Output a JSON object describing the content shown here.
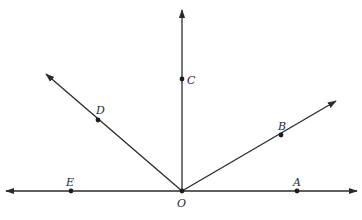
{
  "diagram": {
    "type": "rays-from-point",
    "stroke_color": "#2a2a2a",
    "points": {
      "O": {
        "label": "O",
        "x": 182,
        "y": 191
      },
      "A": {
        "label": "A",
        "x": 297,
        "y": 191
      },
      "B": {
        "label": "B",
        "x": 281,
        "y": 135
      },
      "C": {
        "label": "C",
        "x": 182,
        "y": 79
      },
      "D": {
        "label": "D",
        "x": 98,
        "y": 120
      },
      "E": {
        "label": "E",
        "x": 71,
        "y": 191
      }
    },
    "rays": [
      {
        "name": "ray-OA",
        "through": "A",
        "direction": "right"
      },
      {
        "name": "ray-OB",
        "through": "B",
        "direction": "upper-right"
      },
      {
        "name": "ray-OC",
        "through": "C",
        "direction": "up"
      },
      {
        "name": "ray-OD",
        "through": "D",
        "direction": "upper-left"
      },
      {
        "name": "ray-OE",
        "through": "E",
        "direction": "left"
      }
    ]
  }
}
